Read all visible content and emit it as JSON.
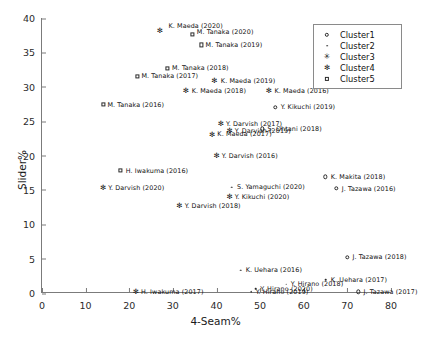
{
  "chart_data": {
    "type": "scatter",
    "title": "",
    "xlabel": "4-Seam%",
    "ylabel": "Slider%",
    "xlim": [
      0,
      80
    ],
    "ylim": [
      0,
      40
    ],
    "xticks": [
      0,
      10,
      20,
      30,
      40,
      50,
      60,
      70,
      80
    ],
    "yticks": [
      0,
      5,
      10,
      15,
      20,
      25,
      30,
      35,
      40
    ],
    "grid": false,
    "legend_position": "upper right",
    "legend": [
      {
        "label": "Cluster1",
        "marker": "circle"
      },
      {
        "label": "Cluster2",
        "marker": "dot"
      },
      {
        "label": "Cluster3",
        "marker": "star-open"
      },
      {
        "label": "Cluster4",
        "marker": "star-filled"
      },
      {
        "label": "Cluster5",
        "marker": "square"
      }
    ],
    "points": [
      {
        "label": "K. Maeda (2020)",
        "x": 27.0,
        "y": 38.2,
        "marker": "star-filled",
        "lx": 29.0,
        "ly": 38.9
      },
      {
        "label": "M. Tanaka (2020)",
        "x": 34.5,
        "y": 37.6,
        "marker": "square",
        "lx": 35.5,
        "ly": 38.0
      },
      {
        "label": "M. Tanaka (2019)",
        "x": 36.5,
        "y": 36.1,
        "marker": "square",
        "lx": 37.5,
        "ly": 36.1
      },
      {
        "label": "M. Tanaka (2018)",
        "x": 28.8,
        "y": 32.7,
        "marker": "square",
        "lx": 29.8,
        "ly": 32.7
      },
      {
        "label": "M. Tanaka (2017)",
        "x": 21.8,
        "y": 31.5,
        "marker": "square",
        "lx": 22.8,
        "ly": 31.5
      },
      {
        "label": "K. Maeda (2019)",
        "x": 39.5,
        "y": 30.9,
        "marker": "star-filled",
        "lx": 41.0,
        "ly": 30.9
      },
      {
        "label": "K. Maeda (2018)",
        "x": 33.0,
        "y": 29.4,
        "marker": "star-filled",
        "lx": 34.3,
        "ly": 29.4
      },
      {
        "label": "K. Maeda (2016)",
        "x": 52.0,
        "y": 29.4,
        "marker": "star-filled",
        "lx": 53.3,
        "ly": 29.4
      },
      {
        "label": "M. Tanaka (2016)",
        "x": 14.0,
        "y": 27.4,
        "marker": "square",
        "lx": 15.0,
        "ly": 27.4
      },
      {
        "label": "Y. Kikuchi (2019)",
        "x": 53.5,
        "y": 27.0,
        "marker": "circle",
        "lx": 54.7,
        "ly": 27.0
      },
      {
        "label": "Y. Darvish (2017)",
        "x": 41.0,
        "y": 24.6,
        "marker": "star-filled",
        "lx": 42.2,
        "ly": 24.6
      },
      {
        "label": "S. Ohtani (2018)",
        "x": 50.5,
        "y": 23.9,
        "marker": "circle",
        "lx": 51.7,
        "ly": 23.9
      },
      {
        "label": "Y. Darvish (2019)",
        "x": 43.0,
        "y": 23.6,
        "marker": "star-filled",
        "lx": 44.2,
        "ly": 23.6
      },
      {
        "label": "K. Maeda (2017)",
        "x": 39.0,
        "y": 23.1,
        "marker": "star-filled",
        "lx": 40.2,
        "ly": 23.1
      },
      {
        "label": "Y. Darvish (2016)",
        "x": 40.0,
        "y": 20.0,
        "marker": "star-filled",
        "lx": 41.2,
        "ly": 20.0
      },
      {
        "label": "H. Iwakuma (2016)",
        "x": 18.0,
        "y": 17.8,
        "marker": "square",
        "lx": 19.2,
        "ly": 17.8
      },
      {
        "label": "K. Makita (2018)",
        "x": 65.0,
        "y": 16.9,
        "marker": "circle",
        "lx": 66.2,
        "ly": 16.9
      },
      {
        "label": "Y. Darvish (2020)",
        "x": 14.0,
        "y": 15.3,
        "marker": "star-filled",
        "lx": 15.2,
        "ly": 15.3
      },
      {
        "label": "S. Yamaguchi (2020)",
        "x": 43.5,
        "y": 15.4,
        "marker": "dot",
        "lx": 44.7,
        "ly": 15.4
      },
      {
        "label": "J. Tazawa (2016)",
        "x": 67.5,
        "y": 15.2,
        "marker": "circle",
        "lx": 68.7,
        "ly": 15.2
      },
      {
        "label": "Y. Kikuchi (2020)",
        "x": 43.0,
        "y": 14.0,
        "marker": "star-filled",
        "lx": 44.2,
        "ly": 14.0
      },
      {
        "label": "Y. Darvish (2018)",
        "x": 31.5,
        "y": 12.7,
        "marker": "star-filled",
        "lx": 32.7,
        "ly": 12.7
      },
      {
        "label": "J. Tazawa (2018)",
        "x": 70.0,
        "y": 5.2,
        "marker": "circle",
        "lx": 71.2,
        "ly": 5.2
      },
      {
        "label": "K. Uehara (2016)",
        "x": 45.5,
        "y": 3.3,
        "marker": "dot",
        "lx": 46.7,
        "ly": 3.3
      },
      {
        "label": "K. Uehara (2017)",
        "x": 65.0,
        "y": 1.9,
        "marker": "dot",
        "lx": 66.2,
        "ly": 1.9
      },
      {
        "label": "Y. Hirano (2018)",
        "x": 56.0,
        "y": 1.3,
        "marker": "dot",
        "lx": 57.0,
        "ly": 1.3
      },
      {
        "label": "Y. Hirano (2020)",
        "x": 49.0,
        "y": 0.6,
        "marker": "dot",
        "lx": 50.0,
        "ly": 0.6
      },
      {
        "label": "Y. Hirano (2019)",
        "x": 48.0,
        "y": 0.15,
        "marker": "dot",
        "lx": 49.0,
        "ly": 0.15
      },
      {
        "label": "H. Iwakuma (2017)",
        "x": 21.5,
        "y": 0.2,
        "marker": "star-filled",
        "lx": 22.7,
        "ly": 0.2
      },
      {
        "label": "J. Tazawa (2017)",
        "x": 72.5,
        "y": 0.2,
        "marker": "circle",
        "lx": 73.7,
        "ly": 0.2
      }
    ]
  }
}
